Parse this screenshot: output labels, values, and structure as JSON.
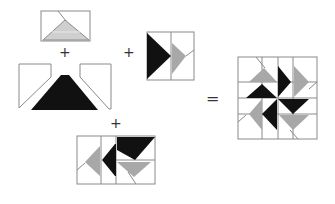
{
  "diagram": {
    "type": "quilt-block-assembly",
    "operators": {
      "plus1": "+",
      "plus2": "+",
      "plus3": "+",
      "equals": "="
    },
    "colors": {
      "outline": "#8a8a8a",
      "black": "#111111",
      "gray": "#a8a8a8",
      "light_gray": "#cfcfcf",
      "white": "#ffffff"
    },
    "pieces": [
      {
        "id": "top-rectangle-with-gray-triangle"
      },
      {
        "id": "left-white-trapezoid"
      },
      {
        "id": "black-trapezoid"
      },
      {
        "id": "right-white-trapezoid"
      },
      {
        "id": "square-black-gray-triangles"
      },
      {
        "id": "bottom-rectangle-unit"
      },
      {
        "id": "final-pinwheel-block"
      }
    ]
  }
}
